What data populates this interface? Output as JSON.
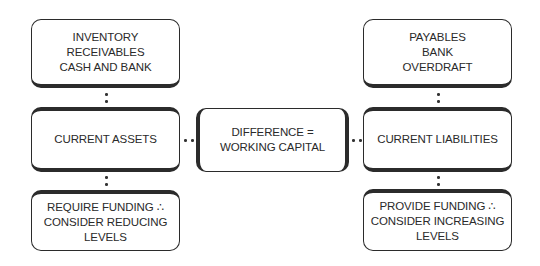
{
  "diagram": {
    "left": {
      "top": "INVENTORY RECEIVABLES\nCASH AND BANK",
      "middle": "CURRENT ASSETS",
      "bottom": "REQUIRE FUNDING ∴\nCONSIDER REDUCING\nLEVELS"
    },
    "center": "DIFFERENCE =\nWORKING CAPITAL",
    "right": {
      "top": "PAYABLES\nBANK\nOVERDRAFT",
      "middle": "CURRENT LIABILITIES",
      "bottom": "PROVIDE FUNDING ∴\nCONSIDER INCREASING\nLEVELS"
    },
    "colors": {
      "border": "#2b2b2b",
      "text": "#2a2a2a",
      "background": "#ffffff"
    }
  }
}
